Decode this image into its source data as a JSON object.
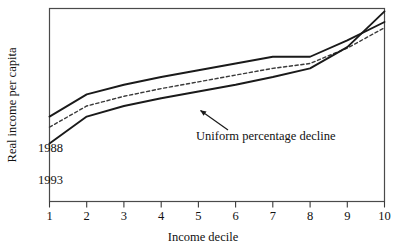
{
  "chart_data": {
    "type": "line",
    "title": "",
    "xlabel": "Income decile",
    "ylabel": "Real income per capita",
    "categories": [
      "1",
      "2",
      "3",
      "4",
      "5",
      "6",
      "7",
      "8",
      "9",
      "10"
    ],
    "x": [
      1,
      2,
      3,
      4,
      5,
      6,
      7,
      8,
      9,
      10
    ],
    "xlim": [
      1,
      10
    ],
    "ylim": [
      0,
      100
    ],
    "grid": false,
    "legend_position": "inline-labels",
    "axis_ticks_y": [],
    "series": [
      {
        "name": "1988",
        "style": "solid",
        "color": "#1a1a1a",
        "label_text": "1988",
        "values": [
          44.0,
          55.5,
          60.5,
          64.5,
          68.0,
          71.5,
          75.0,
          75.0,
          83.5,
          93.0
        ]
      },
      {
        "name": "Uniform percentage decline",
        "style": "dashed",
        "color": "#3a3a3a",
        "label_text": "Uniform percentage decline",
        "values": [
          38.5,
          49.5,
          54.5,
          58.5,
          62.0,
          65.5,
          69.0,
          71.5,
          79.5,
          90.0
        ]
      },
      {
        "name": "1993",
        "style": "solid",
        "color": "#1a1a1a",
        "label_text": "1993",
        "values": [
          30.0,
          44.0,
          49.5,
          53.5,
          57.0,
          60.5,
          64.5,
          69.0,
          80.0,
          98.5
        ]
      }
    ],
    "annotations": [
      {
        "text": "Uniform percentage decline",
        "target_series": "Uniform percentage decline",
        "target_x": 5.0,
        "leader": true,
        "arrow": true
      }
    ]
  },
  "labels": {
    "y_axis_title": "Real income per capita",
    "x_axis_title": "Income decile",
    "series_1988": "1988",
    "series_1993": "1993",
    "annotation": "Uniform percentage decline",
    "tick_1": "1",
    "tick_2": "2",
    "tick_3": "3",
    "tick_4": "4",
    "tick_5": "5",
    "tick_6": "6",
    "tick_7": "7",
    "tick_8": "8",
    "tick_9": "9",
    "tick_10": "10"
  },
  "colors": {
    "frame": "#4a4a4a",
    "line": "#1a1a1a",
    "dashed": "#3a3a3a",
    "text": "#111111",
    "background": "#ffffff"
  }
}
